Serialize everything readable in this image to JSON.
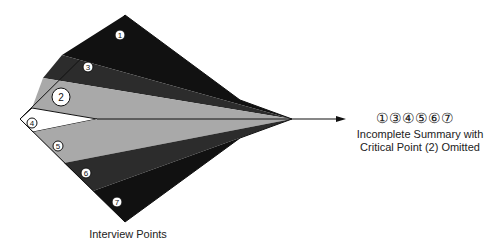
{
  "diagram": {
    "left_caption": "Interview Points",
    "result_points": "①③④⑤⑥⑦",
    "result_caption_line1": "Incomplete Summary with",
    "result_caption_line2": "Critical Point (2) Omitted",
    "points": [
      {
        "id": "1",
        "glyph": "1",
        "shade": "#111111"
      },
      {
        "id": "3",
        "glyph": "3",
        "shade": "#2a2a2a"
      },
      {
        "id": "2",
        "glyph": "2",
        "shade": "#a8a8a8",
        "emphasized": true
      },
      {
        "id": "4",
        "glyph": "4",
        "shade": "#ffffff"
      },
      {
        "id": "5",
        "glyph": "5",
        "shade": "#a8a8a8"
      },
      {
        "id": "6",
        "glyph": "6",
        "shade": "#2a2a2a"
      },
      {
        "id": "7",
        "glyph": "7",
        "shade": "#111111"
      }
    ]
  }
}
